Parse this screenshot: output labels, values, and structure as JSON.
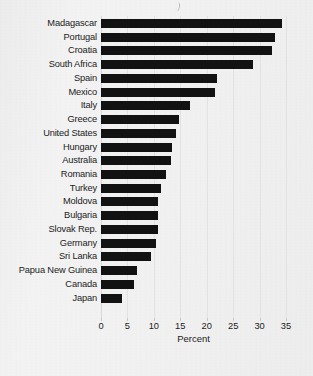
{
  "chart_data": {
    "type": "bar",
    "orientation": "horizontal",
    "title": "",
    "subtitle": "",
    "xlabel": "Percent",
    "ylabel": "",
    "xlim": [
      0,
      35
    ],
    "ylim": null,
    "grid": true,
    "legend": null,
    "legend_position": "none",
    "xticks": [
      0,
      5,
      10,
      15,
      20,
      25,
      30,
      35
    ],
    "xtick_labels": [
      "0",
      "5",
      "10",
      "15",
      "20",
      "25",
      "30",
      "35"
    ],
    "bar_color": "#121212",
    "background_color": "#f1f1f1",
    "categories": [
      "Madagascar",
      "Portugal",
      "Croatia",
      "South Africa",
      "Spain",
      "Mexico",
      "Italy",
      "Greece",
      "United States",
      "Hungary",
      "Australia",
      "Romania",
      "Turkey",
      "Moldova",
      "Bulgaria",
      "Slovak Rep.",
      "Germany",
      "Sri Lanka",
      "Papua New Guinea",
      "Canada",
      "Japan"
    ],
    "values": [
      34.2,
      32.9,
      32.3,
      28.7,
      22.0,
      21.6,
      16.8,
      14.7,
      14.2,
      13.4,
      13.3,
      12.3,
      11.3,
      10.8,
      10.8,
      10.8,
      10.4,
      9.4,
      6.9,
      6.2,
      4.0
    ]
  },
  "axis": {
    "x_title": "Percent"
  },
  "footnote": {
    "text": ""
  }
}
